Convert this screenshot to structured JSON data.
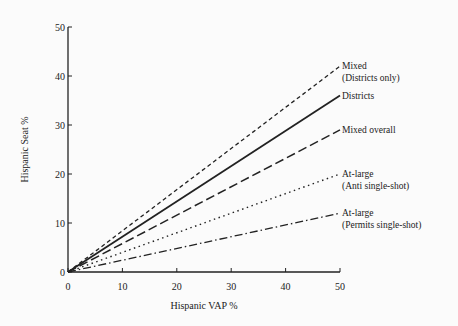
{
  "chart_data": {
    "type": "line",
    "title": "",
    "xlabel": "Hispanic VAP %",
    "ylabel": "Hispanic Seat %",
    "xlim": [
      0,
      50
    ],
    "ylim": [
      0,
      50
    ],
    "xticks": [
      0,
      10,
      20,
      30,
      40,
      50
    ],
    "yticks": [
      0,
      10,
      20,
      30,
      40,
      50
    ],
    "grid": false,
    "legend_position": "inline-right",
    "series": [
      {
        "name": "Mixed (Districts only)",
        "label_lines": [
          "Mixed",
          "(Districts only)"
        ],
        "style": "short-dash",
        "x": [
          0,
          50
        ],
        "y": [
          0,
          42
        ]
      },
      {
        "name": "Districts",
        "label_lines": [
          "Districts"
        ],
        "style": "solid",
        "x": [
          0,
          50
        ],
        "y": [
          0,
          36
        ]
      },
      {
        "name": "Mixed overall",
        "label_lines": [
          "Mixed overall"
        ],
        "style": "long-dash",
        "x": [
          0,
          50
        ],
        "y": [
          0,
          29
        ]
      },
      {
        "name": "At-large (Anti single-shot)",
        "label_lines": [
          "At-large",
          "(Anti single-shot)"
        ],
        "style": "dotted",
        "x": [
          0,
          50
        ],
        "y": [
          0,
          20
        ]
      },
      {
        "name": "At-large (Permits single-shot)",
        "label_lines": [
          "At-large",
          "(Permits single-shot)"
        ],
        "style": "dash-dot",
        "x": [
          0,
          50
        ],
        "y": [
          0,
          12
        ]
      }
    ]
  }
}
